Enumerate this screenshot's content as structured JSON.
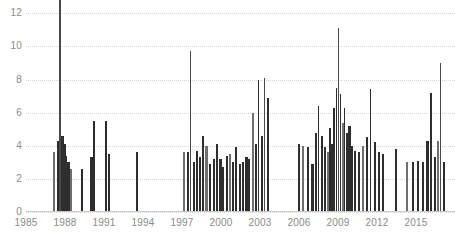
{
  "chart_data": {
    "type": "bar",
    "title": "",
    "subtitle": "",
    "xlabel": "",
    "ylabel": "",
    "xlim": [
      1985,
      2018
    ],
    "ylim": [
      0,
      12.8
    ],
    "grid": true,
    "legend": null,
    "note": "Dense vertical-line time series; each bar is one event/date. Values above the top gridline are clipped by the image frame.",
    "y_ticks": [
      0,
      2,
      4,
      6,
      8,
      10,
      12
    ],
    "x_ticks": [
      1985,
      1988,
      1991,
      1994,
      1997,
      2000,
      2003,
      2006,
      2009,
      2012,
      2015
    ],
    "colors": {
      "bar": "#2e2e2e",
      "bar_light": "#6f6f6f",
      "grid": "#d6d6d6",
      "axis": "#c9c9c9",
      "tick_label": "#8a8a8a",
      "background": "#ffffff"
    },
    "x": [
      1987.05,
      1987.35,
      1987.55,
      1987.72,
      1987.88,
      1988.02,
      1988.18,
      1988.35,
      1989.25,
      1989.95,
      1990.15,
      1991.05,
      1991.3,
      1993.45,
      1997.1,
      1997.35,
      1997.6,
      1997.85,
      1998.05,
      1998.3,
      1998.55,
      1998.8,
      1999.1,
      1999.35,
      1999.62,
      1999.88,
      2000.1,
      2000.35,
      2000.6,
      2000.85,
      2001.1,
      2001.38,
      2001.62,
      2001.88,
      2002.1,
      2002.35,
      2002.58,
      2002.82,
      2003.05,
      2003.28,
      2003.55,
      2005.9,
      2006.2,
      2006.6,
      2006.95,
      2007.2,
      2007.45,
      2007.7,
      2007.92,
      2008.12,
      2008.3,
      2008.48,
      2008.65,
      2008.82,
      2008.98,
      2009.12,
      2009.28,
      2009.45,
      2009.62,
      2009.8,
      2010.0,
      2010.25,
      2010.55,
      2010.85,
      2011.15,
      2011.45,
      2011.75,
      2012.05,
      2012.35,
      2013.4,
      2014.25,
      2014.7,
      2015.1,
      2015.45,
      2015.8,
      2016.1,
      2016.35,
      2016.6,
      2016.85,
      2017.1
    ],
    "values": [
      3.6,
      4.3,
      13.6,
      4.6,
      4.1,
      3.4,
      3.0,
      2.6,
      2.6,
      3.3,
      5.5,
      5.5,
      3.5,
      3.6,
      3.6,
      3.6,
      9.7,
      3.0,
      3.7,
      3.3,
      4.6,
      4.0,
      2.9,
      3.2,
      4.1,
      3.2,
      2.7,
      3.4,
      3.5,
      3.0,
      3.9,
      2.9,
      3.0,
      3.3,
      3.2,
      6.0,
      4.1,
      8.0,
      4.6,
      8.1,
      6.9,
      4.1,
      4.0,
      3.9,
      2.9,
      4.8,
      6.4,
      4.6,
      3.9,
      3.6,
      5.1,
      4.1,
      6.3,
      7.5,
      11.1,
      7.1,
      5.4,
      6.3,
      4.8,
      5.2,
      4.0,
      3.7,
      3.6,
      4.0,
      4.5,
      7.4,
      4.2,
      3.6,
      3.5,
      3.8,
      3.0,
      3.0,
      3.1,
      3.0,
      4.3,
      7.2,
      3.3,
      4.3,
      9.0,
      3.0
    ]
  }
}
